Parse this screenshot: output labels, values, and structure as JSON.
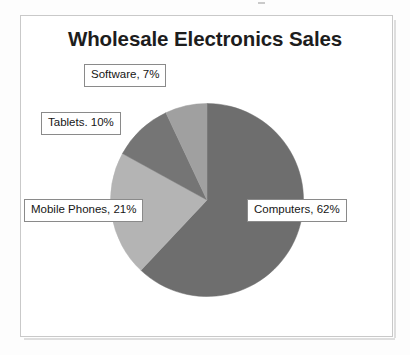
{
  "chart_data": {
    "type": "pie",
    "title": "Wholesale Electronics Sales",
    "xlabel": "",
    "ylabel": "",
    "legend": "none",
    "grid": false,
    "start_angle_deg": 0,
    "direction": "clockwise",
    "categories": [
      "Computers",
      "Mobile Phones",
      "Tablets",
      "Software"
    ],
    "values": [
      62,
      21,
      10,
      7
    ],
    "unit": "%",
    "labels": [
      {
        "key": "computers",
        "text": "Computers, 62%",
        "category": "Computers",
        "value": 62,
        "color": "#6e6e6e"
      },
      {
        "key": "mobile_phones",
        "text": "Mobile Phones, 21%",
        "category": "Mobile Phones",
        "value": 21,
        "color": "#b4b4b4"
      },
      {
        "key": "tablets",
        "text": "Tablets. 10%",
        "category": "Tablets",
        "value": 10,
        "color": "#757575"
      },
      {
        "key": "software",
        "text": "Software, 7%",
        "category": "Software",
        "value": 7,
        "color": "#a0a0a0"
      }
    ],
    "slice_colors": {
      "computers": "#6e6e6e",
      "mobile_phones": "#b4b4b4",
      "tablets": "#757575",
      "software": "#a0a0a0"
    }
  },
  "frame": {
    "border_color": "#c9c9c9",
    "background": "#ffffff"
  }
}
